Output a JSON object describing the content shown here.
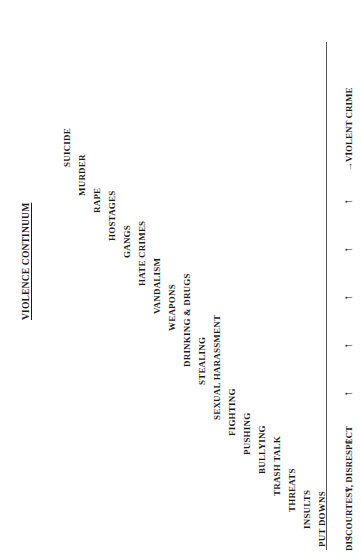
{
  "figure": {
    "title": "VIOLENCE CONTINUUM",
    "orientation_note": "rotated-90-ccw"
  },
  "chart_data": {
    "type": "diagram",
    "title": "VIOLENCE CONTINUUM",
    "xlabel": "",
    "ylabel": "",
    "axis_start_label": "DISCOURTESY, DISRESPECT",
    "axis_end_label": "VIOLENT CRIME",
    "axis_arrow_count": 9,
    "categories": [
      "PUT DOWNS",
      "INSULTS",
      "THREATS",
      "TRASH TALK",
      "BULLYING",
      "PUSHING",
      "FIGHTING",
      "SEXUAL HARASSMENT",
      "STEALING",
      "DRINKING & DRUGS",
      "WEAPONS",
      "VANDALISM",
      "HATE CRIMES",
      "GANGS",
      "HOSTAGES",
      "RAPE",
      "MURDER",
      "SUICIDE"
    ],
    "values": [
      1,
      2,
      3,
      4,
      5,
      6,
      7,
      8,
      9,
      10,
      11,
      12,
      13,
      14,
      15,
      16,
      17,
      18
    ],
    "legend": [],
    "grid": false
  },
  "steps": [
    {
      "label": "PUT DOWNS",
      "x": 318,
      "y": 547
    },
    {
      "label": "INSULTS",
      "x": 303,
      "y": 529
    },
    {
      "label": "THREATS",
      "x": 288,
      "y": 512
    },
    {
      "label": "TRASH TALK",
      "x": 273,
      "y": 496
    },
    {
      "label": "BULLYING",
      "x": 258,
      "y": 474
    },
    {
      "label": "PUSHING",
      "x": 243,
      "y": 455
    },
    {
      "label": "FIGHTING",
      "x": 228,
      "y": 436
    },
    {
      "label": "SEXUAL HARASSMENT",
      "x": 213,
      "y": 420
    },
    {
      "label": "STEALING",
      "x": 198,
      "y": 385
    },
    {
      "label": "DRINKING & DRUGS",
      "x": 183,
      "y": 367
    },
    {
      "label": "WEAPONS",
      "x": 168,
      "y": 331
    },
    {
      "label": "VANDALISM",
      "x": 153,
      "y": 314
    },
    {
      "label": "HATE CRIMES",
      "x": 138,
      "y": 286
    },
    {
      "label": "GANGS",
      "x": 123,
      "y": 258
    },
    {
      "label": "HOSTAGES",
      "x": 108,
      "y": 241
    },
    {
      "label": "RAPE",
      "x": 93,
      "y": 213
    },
    {
      "label": "MURDER",
      "x": 78,
      "y": 196
    },
    {
      "label": "SUICIDE",
      "x": 63,
      "y": 167
    }
  ],
  "axis": {
    "start_caption": "DISCOURTESY, DISRESPECT",
    "end_caption": "VIOLENT CRIME",
    "arrow_glyph": "↑",
    "end_arrow_glyph": "→",
    "arrows": [
      {
        "y": 541
      },
      {
        "y": 493
      },
      {
        "y": 445
      },
      {
        "y": 397
      },
      {
        "y": 349
      },
      {
        "y": 301
      },
      {
        "y": 253
      },
      {
        "y": 205
      },
      {
        "y": 157
      }
    ]
  },
  "colors": {
    "ink": "#1a1a1a",
    "axis": "#555555",
    "background": "#ffffff"
  }
}
